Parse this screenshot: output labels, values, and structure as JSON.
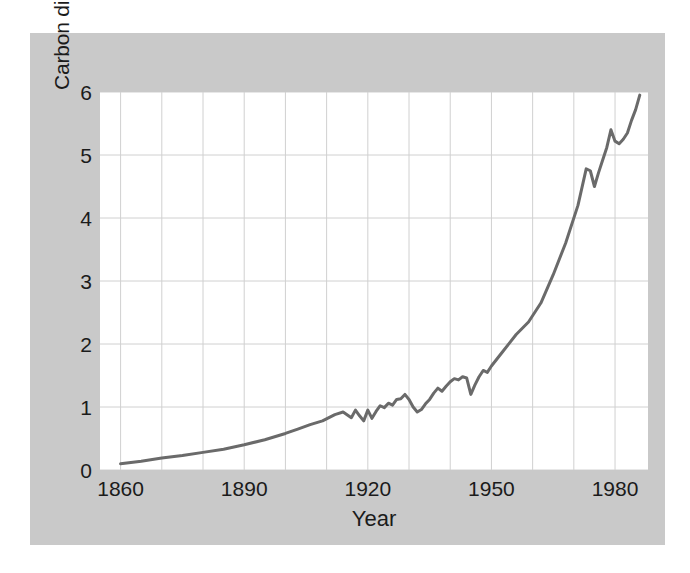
{
  "chart_data": {
    "type": "line",
    "title": "",
    "xlabel": "Year",
    "ylabel": "Carbon dioxide emissions (billions of tons per year)",
    "xlim": [
      1855,
      1988
    ],
    "ylim": [
      0,
      6
    ],
    "xticks": [
      "1860",
      "1890",
      "1920",
      "1950",
      "1980"
    ],
    "xtick_values": [
      1860,
      1890,
      1920,
      1950,
      1980
    ],
    "yticks": [
      "0",
      "1",
      "2",
      "3",
      "4",
      "5",
      "6"
    ],
    "ytick_values": [
      0,
      1,
      2,
      3,
      4,
      5,
      6
    ],
    "grid": true,
    "grid_x_step": 10,
    "grid_y_step": 1,
    "legend": null,
    "legend_position": "none",
    "series": [
      {
        "name": "Carbon dioxide emissions",
        "units": "billions of tons per year",
        "x": [
          1860,
          1865,
          1870,
          1875,
          1880,
          1885,
          1890,
          1895,
          1900,
          1903,
          1906,
          1909,
          1912,
          1914,
          1916,
          1917,
          1918,
          1919,
          1920,
          1921,
          1922,
          1923,
          1924,
          1925,
          1926,
          1927,
          1928,
          1929,
          1930,
          1931,
          1932,
          1933,
          1934,
          1935,
          1936,
          1937,
          1938,
          1939,
          1940,
          1941,
          1942,
          1943,
          1944,
          1945,
          1946,
          1947,
          1948,
          1949,
          1950,
          1953,
          1956,
          1959,
          1962,
          1965,
          1968,
          1971,
          1973,
          1974,
          1975,
          1976,
          1977,
          1978,
          1979,
          1980,
          1981,
          1982,
          1983,
          1984,
          1985,
          1986
        ],
        "y": [
          0.1,
          0.14,
          0.19,
          0.23,
          0.28,
          0.33,
          0.4,
          0.48,
          0.58,
          0.65,
          0.72,
          0.78,
          0.88,
          0.92,
          0.83,
          0.95,
          0.86,
          0.78,
          0.95,
          0.82,
          0.93,
          1.02,
          0.99,
          1.06,
          1.03,
          1.12,
          1.13,
          1.2,
          1.12,
          1.0,
          0.92,
          0.96,
          1.05,
          1.12,
          1.22,
          1.3,
          1.25,
          1.33,
          1.4,
          1.45,
          1.43,
          1.48,
          1.46,
          1.2,
          1.35,
          1.48,
          1.58,
          1.55,
          1.65,
          1.9,
          2.15,
          2.35,
          2.65,
          3.1,
          3.6,
          4.2,
          4.78,
          4.75,
          4.5,
          4.72,
          4.92,
          5.12,
          5.4,
          5.22,
          5.18,
          5.25,
          5.35,
          5.55,
          5.72,
          5.95
        ]
      }
    ],
    "annotations": [],
    "colors": {
      "line": "#6a6a6a",
      "plot_background": "#ffffff",
      "frame_background": "#c9c9c9",
      "gridline": "#d0d0d0",
      "text": "#1b1b1b",
      "page_background": "#ffffff"
    },
    "line_width": 3
  }
}
